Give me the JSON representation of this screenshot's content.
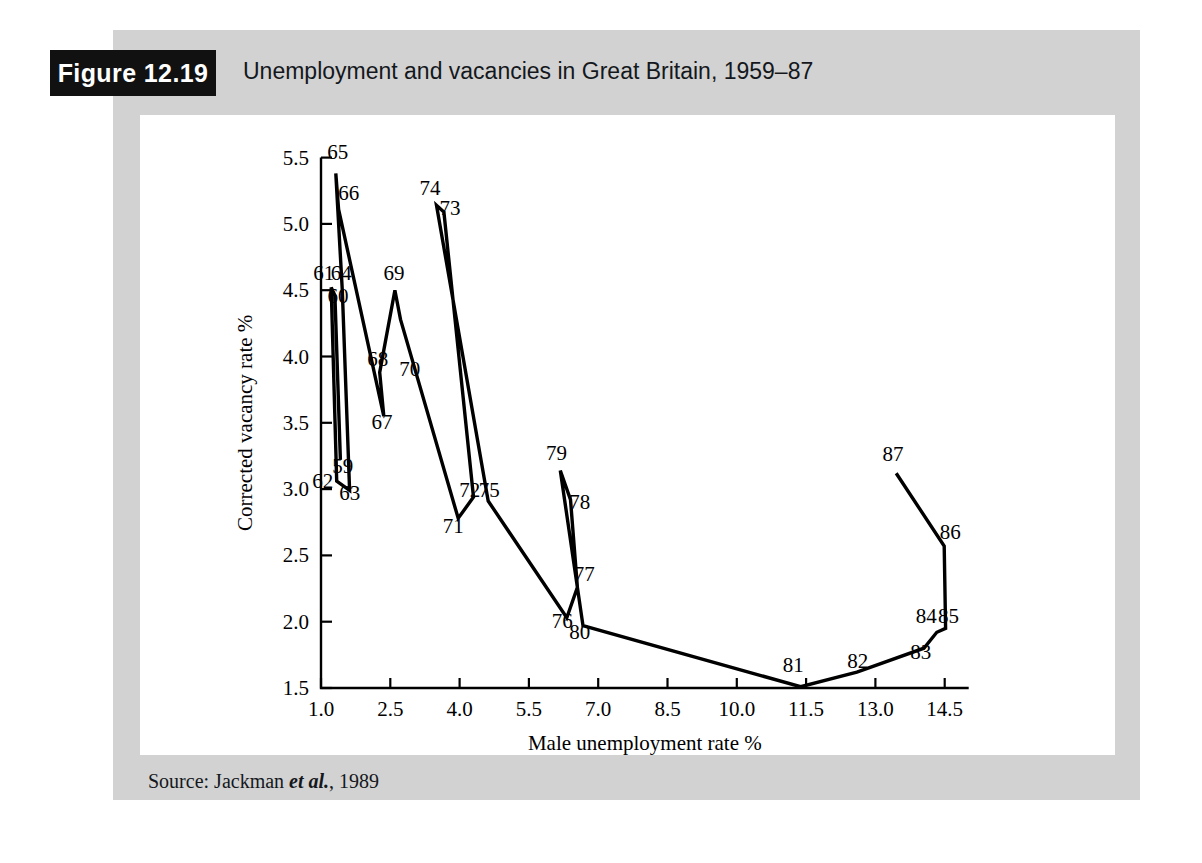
{
  "figure": {
    "badge_label": "Figure 12.19",
    "title": "Unemployment and vacancies in Great Britain, 1959–87",
    "source": "Source: Jackman ",
    "source_italic": "et al.",
    "source_tail": ", 1989"
  },
  "chart_data": {
    "type": "line",
    "title": "Unemployment and vacancies in Great Britain, 1959–87",
    "xlabel": "Male unemployment rate %",
    "ylabel": "Corrected vacancy rate %",
    "xlim": [
      1.0,
      14.5
    ],
    "ylim": [
      1.5,
      5.5
    ],
    "xticks": [
      "1.0",
      "2.5",
      "4.0",
      "5.5",
      "7.0",
      "8.5",
      "10.0",
      "11.5",
      "13.0",
      "14.5"
    ],
    "yticks": [
      "1.5",
      "2.0",
      "2.5",
      "3.0",
      "3.5",
      "4.0",
      "4.5",
      "5.0",
      "5.5"
    ],
    "grid": false,
    "legend": "none",
    "series": [
      {
        "name": "UK Beveridge curve 1959-87",
        "points": [
          {
            "label": "59",
            "x": 1.42,
            "y": 3.22,
            "lx": 1.47,
            "ly": 3.12
          },
          {
            "label": "60",
            "x": 1.3,
            "y": 4.46,
            "lx": 1.37,
            "ly": 4.4
          },
          {
            "label": "61",
            "x": 1.22,
            "y": 4.52,
            "lx": 1.06,
            "ly": 4.58
          },
          {
            "label": "62",
            "x": 1.34,
            "y": 3.06,
            "lx": 1.04,
            "ly": 3.01
          },
          {
            "label": "63",
            "x": 1.62,
            "y": 2.99,
            "lx": 1.62,
            "ly": 2.92
          },
          {
            "label": "64",
            "x": 1.46,
            "y": 4.5,
            "lx": 1.44,
            "ly": 4.58
          },
          {
            "label": "65",
            "x": 1.32,
            "y": 5.38,
            "lx": 1.36,
            "ly": 5.49
          },
          {
            "label": "66",
            "x": 1.38,
            "y": 5.11,
            "lx": 1.6,
            "ly": 5.18
          },
          {
            "label": "67",
            "x": 2.36,
            "y": 3.55,
            "lx": 2.32,
            "ly": 3.45
          },
          {
            "label": "68",
            "x": 2.27,
            "y": 3.88,
            "lx": 2.23,
            "ly": 3.93
          },
          {
            "label": "69",
            "x": 2.6,
            "y": 4.5,
            "lx": 2.58,
            "ly": 4.58
          },
          {
            "label": "70",
            "x": 2.72,
            "y": 4.28,
            "lx": 2.92,
            "ly": 3.85
          },
          {
            "label": "71",
            "x": 3.97,
            "y": 2.78,
            "lx": 3.86,
            "ly": 2.67
          },
          {
            "label": "72",
            "x": 4.3,
            "y": 2.94,
            "lx": 4.22,
            "ly": 2.94
          },
          {
            "label": "73",
            "x": 3.66,
            "y": 5.09,
            "lx": 3.79,
            "ly": 5.07
          },
          {
            "label": "74",
            "x": 3.5,
            "y": 5.14,
            "lx": 3.36,
            "ly": 5.22
          },
          {
            "label": "75",
            "x": 4.62,
            "y": 2.91,
            "lx": 4.64,
            "ly": 2.94
          },
          {
            "label": "76",
            "x": 6.32,
            "y": 2.03,
            "lx": 6.22,
            "ly": 1.95
          },
          {
            "label": "77",
            "x": 6.55,
            "y": 2.26,
            "lx": 6.7,
            "ly": 2.31
          },
          {
            "label": "78",
            "x": 6.4,
            "y": 2.92,
            "lx": 6.6,
            "ly": 2.85
          },
          {
            "label": "79",
            "x": 6.18,
            "y": 3.14,
            "lx": 6.1,
            "ly": 3.22
          },
          {
            "label": "80",
            "x": 6.67,
            "y": 1.97,
            "lx": 6.6,
            "ly": 1.87
          },
          {
            "label": "81",
            "x": 11.38,
            "y": 1.51,
            "lx": 11.22,
            "ly": 1.62
          },
          {
            "label": "82",
            "x": 12.6,
            "y": 1.62,
            "lx": 12.62,
            "ly": 1.65
          },
          {
            "label": "83",
            "x": 14.05,
            "y": 1.8,
            "lx": 13.98,
            "ly": 1.72
          },
          {
            "label": "84",
            "x": 14.33,
            "y": 1.92,
            "lx": 14.1,
            "ly": 1.99
          },
          {
            "label": "85",
            "x": 14.52,
            "y": 1.95,
            "lx": 14.58,
            "ly": 1.99
          },
          {
            "label": "86",
            "x": 14.49,
            "y": 2.57,
            "lx": 14.62,
            "ly": 2.62
          },
          {
            "label": "87",
            "x": 13.45,
            "y": 3.12,
            "lx": 13.38,
            "ly": 3.21
          }
        ],
        "path_order": [
          "59",
          "60",
          "61",
          "62",
          "63",
          "64",
          "65",
          "66",
          "67",
          "68",
          "69",
          "70",
          "71",
          "72",
          "73",
          "74",
          "75",
          "76",
          "77",
          "78",
          "79",
          "80",
          "81",
          "82",
          "83",
          "84",
          "85",
          "86",
          "87"
        ]
      }
    ]
  }
}
